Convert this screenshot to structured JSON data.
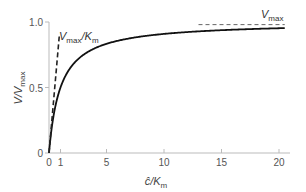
{
  "chart_data": {
    "type": "line",
    "title": "",
    "xlabel": "ĉ/K_m",
    "ylabel": "V/V_max",
    "xlim": [
      0,
      21
    ],
    "ylim": [
      0,
      1.0
    ],
    "grid": false,
    "x_ticks": [
      0,
      1,
      5,
      10,
      15,
      20
    ],
    "x_tick_labels": [
      "0",
      "1",
      "5",
      "10",
      "15",
      "20"
    ],
    "y_ticks": [
      0,
      0.5,
      1.0
    ],
    "y_tick_labels": [
      "0",
      "0.5",
      "1.0"
    ],
    "series": [
      {
        "name": "Michaelis-Menten curve",
        "style": "solid",
        "formula": "V/Vmax = x/(1+x)",
        "x": [
          0,
          0.25,
          0.5,
          1,
          1.5,
          2,
          3,
          4,
          5,
          6,
          8,
          10,
          12,
          15,
          18,
          20.5
        ],
        "y": [
          0,
          0.2,
          0.333,
          0.5,
          0.6,
          0.667,
          0.75,
          0.8,
          0.833,
          0.857,
          0.889,
          0.909,
          0.923,
          0.9375,
          0.947,
          0.953
        ]
      },
      {
        "name": "Initial slope (Vmax/Km)",
        "style": "dashed",
        "x": [
          0,
          0.9
        ],
        "y": [
          0,
          0.9
        ]
      },
      {
        "name": "Vmax asymptote",
        "style": "dashed",
        "x": [
          13,
          20.5
        ],
        "y": [
          0.98,
          0.98
        ]
      }
    ],
    "annotations": [
      {
        "text_main": "V",
        "text_sub": "max",
        "text_rest": "/K",
        "text_sub2": "m",
        "x": 1.2,
        "y": 0.88
      },
      {
        "text_main": "V",
        "text_sub": "max",
        "x": 18,
        "y": 1.0
      }
    ]
  },
  "labels": {
    "y_axis_main": "V/V",
    "y_axis_sub": "max",
    "x_axis_main": "ĉ/K",
    "x_axis_sub": "m",
    "slope_main": "V",
    "slope_sub": "max",
    "slope_rest": "/K",
    "slope_sub2": "m",
    "vmax_main": "V",
    "vmax_sub": "max"
  }
}
